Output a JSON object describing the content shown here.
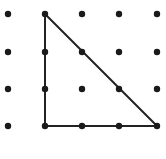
{
  "diagram": {
    "type": "dot-grid-triangle",
    "grid": {
      "columns": 5,
      "rows": 4,
      "x_positions": [
        8,
        45,
        82,
        119,
        157
      ],
      "y_positions": [
        14,
        52,
        89,
        126
      ],
      "dot_radius": 3.2,
      "dot_color": "#1a1a1a"
    },
    "triangle": {
      "vertices_grid": [
        [
          1,
          0
        ],
        [
          1,
          3
        ],
        [
          4,
          3
        ]
      ],
      "stroke_color": "#222222",
      "stroke_width": 2
    }
  }
}
